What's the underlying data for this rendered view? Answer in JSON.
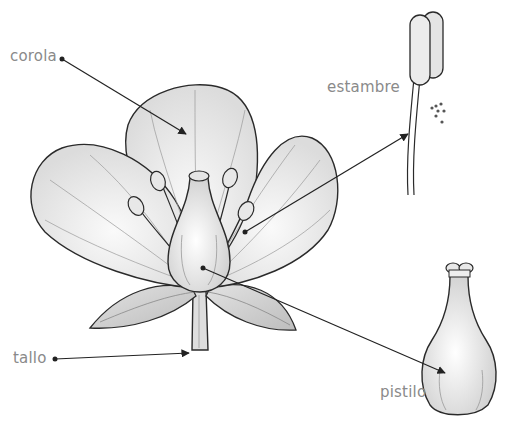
{
  "diagram": {
    "labels": {
      "corola": "corola",
      "estambre": "estambre",
      "tallo": "tallo",
      "pistilo": "pistilo"
    },
    "colors": {
      "background": "#ffffff",
      "label_text": "#8a8a8a",
      "outline": "#2a2a2a",
      "petal_fill": "#f2f2f2",
      "leaf_fill": "#d6d6d6",
      "leader_line": "#222222"
    }
  }
}
